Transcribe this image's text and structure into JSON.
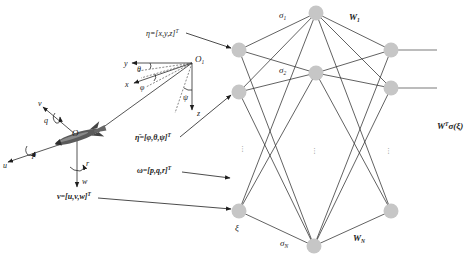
{
  "figure": {
    "earth_frame": {
      "origin": {
        "main": "O",
        "sub": "1"
      },
      "axes": {
        "x": "x",
        "y": "y",
        "z": "z"
      },
      "angles": {
        "theta": "θ",
        "phi": "φ",
        "psi": "ψ"
      }
    },
    "body_frame": {
      "origin": "O",
      "axes": {
        "u": "u",
        "v": "v",
        "w": "w"
      },
      "rates": {
        "p": "p",
        "q": "q",
        "r": "r"
      }
    },
    "inputs": [
      {
        "label": "η=[x,y,z]",
        "sup": "T"
      },
      {
        "label": "η̄=[φ,θ,ψ]",
        "sup": "T"
      },
      {
        "label": "ω=[p,q,r]",
        "sup": "T"
      },
      {
        "label": "ν=[u,v,w]",
        "sup": "T"
      }
    ],
    "network": {
      "input_label": "ξ",
      "hidden_labels": [
        {
          "main": "σ",
          "sub": "1"
        },
        {
          "main": "σ",
          "sub": "2"
        },
        {
          "main": "σ",
          "sub": "N"
        }
      ],
      "weight_labels": [
        {
          "main": "W",
          "sub": "1"
        },
        {
          "main": "W",
          "sub": "N"
        }
      ],
      "ellipsis": "⋮",
      "output_label": {
        "main": "W",
        "sup": "T",
        "rest": "σ(ξ)"
      }
    },
    "colors": {
      "node": "#c6c6c6",
      "line": "#2e2e2e",
      "output_line": "#7a7a7a"
    }
  }
}
